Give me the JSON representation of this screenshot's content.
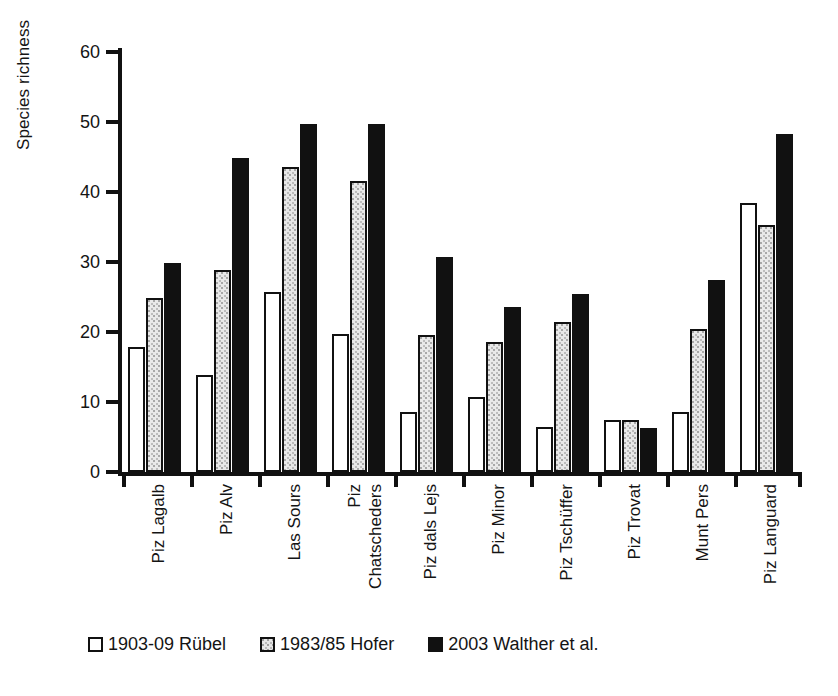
{
  "chart_data": {
    "type": "bar",
    "title": "",
    "xlabel": "",
    "ylabel": "Species richness",
    "ylim": [
      0,
      60
    ],
    "yticks": [
      0,
      10,
      20,
      30,
      40,
      50,
      60
    ],
    "grid": false,
    "legend_position": "bottom",
    "categories": [
      "Piz Lagalb",
      "Piz Alv",
      "Las Sours",
      "Piz Chatscheders",
      "Piz dals Lejs",
      "Piz Minor",
      "Piz Tschüffer",
      "Piz Trovat",
      "Munt Pers",
      "Piz Languard"
    ],
    "category_lines": [
      [
        "Piz Lagalb"
      ],
      [
        "Piz Alv"
      ],
      [
        "Las Sours"
      ],
      [
        "Piz",
        "Chatscheders"
      ],
      [
        "Piz dals Lejs"
      ],
      [
        "Piz Minor"
      ],
      [
        "Piz Tschüffer"
      ],
      [
        "Piz Trovat"
      ],
      [
        "Munt Pers"
      ],
      [
        "Piz Languard"
      ]
    ],
    "series": [
      {
        "name": "1903-09 Rübel",
        "fill": "white",
        "color": "#ffffff",
        "values": [
          17.9,
          13.9,
          25.7,
          19.7,
          8.6,
          10.7,
          6.4,
          7.4,
          8.6,
          38.5
        ]
      },
      {
        "name": "1983/85 Hofer",
        "fill": "stippled-light-grey",
        "color": "#e6e6e6",
        "values": [
          24.9,
          28.9,
          43.6,
          41.6,
          19.6,
          18.6,
          21.5,
          7.4,
          20.5,
          35.3
        ]
      },
      {
        "name": "2003 Walther et al.",
        "fill": "solid-black",
        "color": "#111111",
        "values": [
          29.8,
          44.8,
          49.7,
          49.7,
          30.7,
          23.6,
          25.5,
          6.3,
          27.4,
          48.3
        ]
      }
    ]
  },
  "legend": {
    "items": [
      {
        "label": "1903-09 Rübel",
        "style": "s0"
      },
      {
        "label": "1983/85 Hofer",
        "style": "s1"
      },
      {
        "label": "2003 Walther et al.",
        "style": "s2"
      }
    ]
  }
}
